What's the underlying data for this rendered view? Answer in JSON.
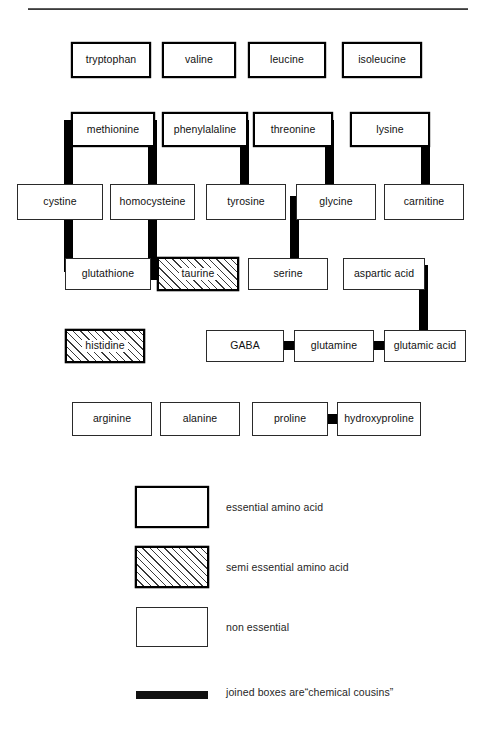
{
  "diagram": {
    "rule": {
      "name": "top-divider"
    },
    "categories": {
      "essential": "essential amino acid",
      "semi_essential": "semi essential amino acid",
      "non_essential": "non essential",
      "connector": "joined boxes are“chemical cousins”"
    },
    "nodes": [
      {
        "id": "tryptophan",
        "label": "tryptophan",
        "type": "essential",
        "x": 72,
        "y": 43,
        "w": 78,
        "h": 34
      },
      {
        "id": "valine",
        "label": "valine",
        "type": "essential",
        "x": 163,
        "y": 43,
        "w": 72,
        "h": 34
      },
      {
        "id": "leucine",
        "label": "leucine",
        "type": "essential",
        "x": 249,
        "y": 43,
        "w": 76,
        "h": 34
      },
      {
        "id": "isoleucine",
        "label": "isoleucine",
        "type": "essential",
        "x": 343,
        "y": 43,
        "w": 78,
        "h": 34
      },
      {
        "id": "methionine",
        "label": "methionine",
        "type": "essential",
        "x": 72,
        "y": 113,
        "w": 82,
        "h": 33
      },
      {
        "id": "phenylalaline",
        "label": "phenylalaline",
        "type": "essential",
        "x": 163,
        "y": 113,
        "w": 84,
        "h": 33
      },
      {
        "id": "threonine",
        "label": "threonine",
        "type": "essential",
        "x": 254,
        "y": 113,
        "w": 78,
        "h": 33
      },
      {
        "id": "lysine",
        "label": "lysine",
        "type": "essential",
        "x": 351,
        "y": 113,
        "w": 78,
        "h": 33
      },
      {
        "id": "cystine",
        "label": "cystine",
        "type": "non_essential",
        "x": 17,
        "y": 184,
        "w": 86,
        "h": 36
      },
      {
        "id": "homocysteine",
        "label": "homocysteine",
        "type": "non_essential",
        "x": 110,
        "y": 184,
        "w": 85,
        "h": 36
      },
      {
        "id": "tyrosine",
        "label": "tyrosine",
        "type": "non_essential",
        "x": 206,
        "y": 184,
        "w": 80,
        "h": 36
      },
      {
        "id": "glycine",
        "label": "glycine",
        "type": "non_essential",
        "x": 296,
        "y": 184,
        "w": 80,
        "h": 36
      },
      {
        "id": "carnitine",
        "label": "carnitine",
        "type": "non_essential",
        "x": 384,
        "y": 184,
        "w": 80,
        "h": 36
      },
      {
        "id": "glutathione",
        "label": "glutathione",
        "type": "non_essential",
        "x": 65,
        "y": 258,
        "w": 86,
        "h": 32
      },
      {
        "id": "taurine",
        "label": "taurine",
        "type": "semi_essential",
        "x": 158,
        "y": 258,
        "w": 80,
        "h": 32
      },
      {
        "id": "serine",
        "label": "serine",
        "type": "non_essential",
        "x": 248,
        "y": 258,
        "w": 80,
        "h": 32
      },
      {
        "id": "aspartic_acid",
        "label": "aspartic acid",
        "type": "non_essential",
        "x": 343,
        "y": 258,
        "w": 82,
        "h": 32
      },
      {
        "id": "histidine",
        "label": "histidine",
        "type": "semi_essential",
        "x": 66,
        "y": 330,
        "w": 78,
        "h": 32
      },
      {
        "id": "gaba",
        "label": "GABA",
        "type": "non_essential",
        "x": 206,
        "y": 330,
        "w": 78,
        "h": 32
      },
      {
        "id": "glutamine",
        "label": "glutamine",
        "type": "non_essential",
        "x": 294,
        "y": 330,
        "w": 80,
        "h": 32
      },
      {
        "id": "glutamic_acid",
        "label": "glutamic acid",
        "type": "non_essential",
        "x": 384,
        "y": 330,
        "w": 82,
        "h": 32
      },
      {
        "id": "arginine",
        "label": "arginine",
        "type": "non_essential",
        "x": 72,
        "y": 402,
        "w": 80,
        "h": 34
      },
      {
        "id": "alanine",
        "label": "alanine",
        "type": "non_essential",
        "x": 160,
        "y": 402,
        "w": 80,
        "h": 34
      },
      {
        "id": "proline",
        "label": "proline",
        "type": "non_essential",
        "x": 252,
        "y": 402,
        "w": 76,
        "h": 34
      },
      {
        "id": "hydroxyproline",
        "label": "hydroxyproline",
        "type": "non_essential",
        "x": 337,
        "y": 402,
        "w": 84,
        "h": 34
      }
    ],
    "connectors": [
      {
        "id": "methionine-cystine",
        "from": "methionine",
        "to": "cystine",
        "x": 64,
        "y": 120,
        "w": 9,
        "h": 96
      },
      {
        "id": "methionine-cystine-stub",
        "from": "methionine",
        "to": "cystine",
        "x": 64,
        "y": 120,
        "w": 12,
        "h": 9
      },
      {
        "id": "methionine-homocysteine",
        "from": "methionine",
        "to": "homocysteine",
        "x": 148,
        "y": 120,
        "w": 9,
        "h": 160
      },
      {
        "id": "methionine-homo-stub",
        "from": "methionine",
        "to": "homocysteine",
        "x": 145,
        "y": 120,
        "w": 12,
        "h": 9
      },
      {
        "id": "cystine-glutathione",
        "from": "cystine",
        "to": "glutathione",
        "x": 64,
        "y": 212,
        "w": 9,
        "h": 60
      },
      {
        "id": "cystine-glutathione-stub",
        "from": "cystine",
        "to": "glutathione",
        "x": 64,
        "y": 263,
        "w": 12,
        "h": 9
      },
      {
        "id": "homocysteine-taurine",
        "from": "homocysteine",
        "to": "taurine",
        "x": 148,
        "y": 271,
        "w": 12,
        "h": 9
      },
      {
        "id": "phenylalaline-tyrosine",
        "from": "phenylalaline",
        "to": "tyrosine",
        "x": 240,
        "y": 120,
        "w": 9,
        "h": 76
      },
      {
        "id": "phenylalaline-tyr-stub",
        "from": "phenylalaline",
        "to": "tyrosine",
        "x": 237,
        "y": 120,
        "w": 12,
        "h": 9
      },
      {
        "id": "threonine-glycine",
        "from": "threonine",
        "to": "glycine",
        "x": 325,
        "y": 120,
        "w": 9,
        "h": 68
      },
      {
        "id": "threonine-glycine-stub",
        "from": "threonine",
        "to": "glycine",
        "x": 322,
        "y": 120,
        "w": 12,
        "h": 9
      },
      {
        "id": "lysine-carnitine",
        "from": "lysine",
        "to": "carnitine",
        "x": 421,
        "y": 120,
        "w": 9,
        "h": 68
      },
      {
        "id": "lysine-carnitine-stub",
        "from": "lysine",
        "to": "carnitine",
        "x": 418,
        "y": 120,
        "w": 12,
        "h": 9
      },
      {
        "id": "glycine-serine",
        "from": "glycine",
        "to": "serine",
        "x": 290,
        "y": 196,
        "w": 9,
        "h": 66
      },
      {
        "id": "glycine-serine-stub",
        "from": "glycine",
        "to": "serine",
        "x": 290,
        "y": 196,
        "w": 12,
        "h": 9
      },
      {
        "id": "aspartic-glutamic",
        "from": "aspartic_acid",
        "to": "glutamic_acid",
        "x": 419,
        "y": 265,
        "w": 9,
        "h": 70
      },
      {
        "id": "aspartic-glutamic-stub",
        "from": "aspartic_acid",
        "to": "glutamic_acid",
        "x": 416,
        "y": 265,
        "w": 12,
        "h": 9
      },
      {
        "id": "gaba-glutamine",
        "from": "gaba",
        "to": "glutamine",
        "x": 282,
        "y": 341,
        "w": 14,
        "h": 9
      },
      {
        "id": "glutamine-glutamic",
        "from": "glutamine",
        "to": "glutamic_acid",
        "x": 372,
        "y": 341,
        "w": 14,
        "h": 9
      },
      {
        "id": "proline-hydroxyproline",
        "from": "proline",
        "to": "hydroxyproline",
        "x": 326,
        "y": 414,
        "w": 13,
        "h": 10
      }
    ],
    "legend": [
      {
        "id": "essential",
        "label": "essential amino acid",
        "style": "essential"
      },
      {
        "id": "semi_essential",
        "label": "semi essential amino acid",
        "style": "semi"
      },
      {
        "id": "non_essential",
        "label": "non essential",
        "style": "nonessential"
      },
      {
        "id": "connector",
        "label": "joined boxes are“chemical cousins”",
        "style": "bar"
      }
    ]
  }
}
